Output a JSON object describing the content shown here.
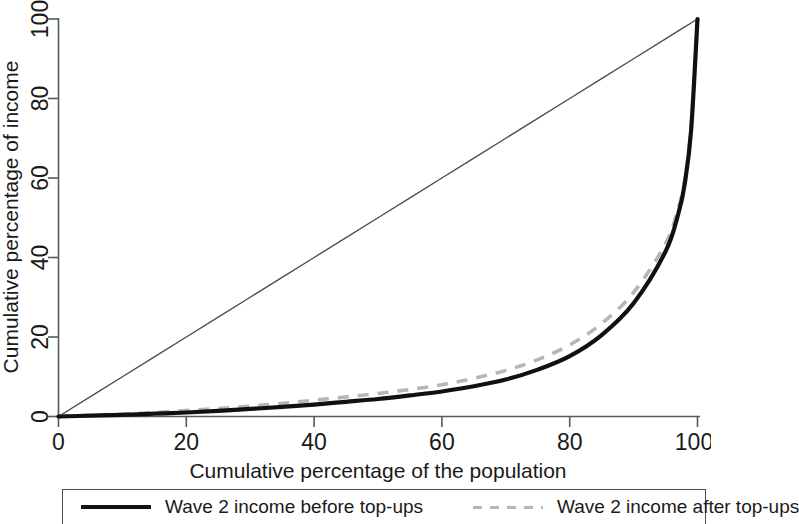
{
  "chart_data": {
    "type": "line",
    "title": "",
    "xlabel": "Cumulative percentage of the population",
    "ylabel": "Cumulative percentage of income",
    "xlim": [
      0,
      100
    ],
    "ylim": [
      0,
      100
    ],
    "xticks": [
      "0",
      "20",
      "40",
      "60",
      "80",
      "100"
    ],
    "yticks": [
      "0",
      "20",
      "40",
      "60",
      "80",
      "100"
    ],
    "grid": false,
    "legend_position": "below-plot",
    "x": [
      0,
      5,
      10,
      15,
      20,
      25,
      30,
      35,
      40,
      45,
      50,
      55,
      60,
      65,
      70,
      75,
      80,
      85,
      90,
      95,
      97,
      98,
      99,
      100
    ],
    "series": [
      {
        "name": "Wave 2 income before top-ups",
        "style": "solid",
        "color": "#111111",
        "values": [
          0,
          0.2,
          0.4,
          0.7,
          1.0,
          1.4,
          1.9,
          2.4,
          3.0,
          3.7,
          4.4,
          5.3,
          6.3,
          7.6,
          9.3,
          11.8,
          15.2,
          20.5,
          28.5,
          41.5,
          51.0,
          58.5,
          72.0,
          100
        ]
      },
      {
        "name": "Wave 2 income after top-ups",
        "style": "dashed",
        "color": "#b4b7b9",
        "values": [
          0,
          0.3,
          0.6,
          1.0,
          1.5,
          2.0,
          2.6,
          3.3,
          4.1,
          4.9,
          5.8,
          6.8,
          8.0,
          9.6,
          11.6,
          14.3,
          18.0,
          23.4,
          31.2,
          43.5,
          52.5,
          59.5,
          72.5,
          100
        ]
      },
      {
        "name": "line of equality",
        "style": "thin-solid",
        "color": "#4a4f52",
        "values": [
          0,
          5,
          10,
          15,
          20,
          25,
          30,
          35,
          40,
          45,
          50,
          55,
          60,
          65,
          70,
          75,
          80,
          85,
          90,
          95,
          97,
          98,
          99,
          100
        ]
      }
    ]
  },
  "legend": {
    "entries": [
      {
        "label": "Wave 2 income before top-ups"
      },
      {
        "label": "Wave 2 income after top-ups"
      }
    ]
  },
  "colors": {
    "before": "#111111",
    "after": "#b4b7b9",
    "axis": "#555b5e",
    "equality": "#4a4f52",
    "background": "#ffffff"
  }
}
